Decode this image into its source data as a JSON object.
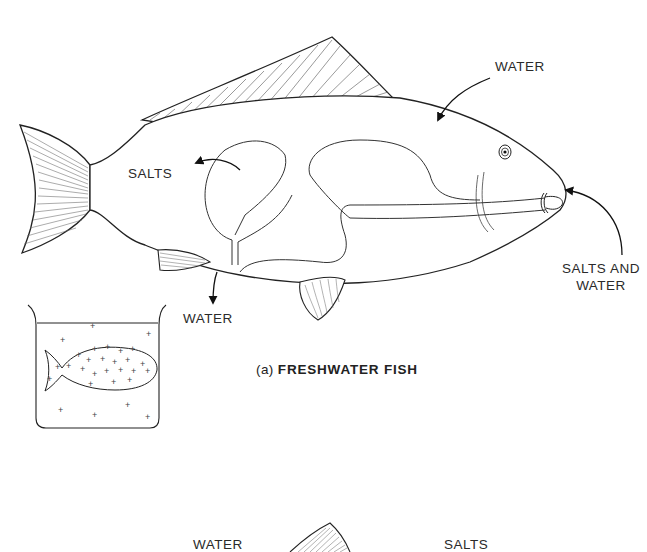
{
  "figure": {
    "panel_a": {
      "caption_prefix": "(a)",
      "caption_title": "FRESHWATER FISH",
      "labels": {
        "water_in_top": "WATER",
        "salts_out": "SALTS",
        "water_out_bottom": "WATER",
        "salts_and_water_line1": "SALTS AND",
        "salts_and_water_line2": "WATER"
      }
    },
    "panel_b_partial": {
      "labels": {
        "water": "WATER",
        "salts": "SALTS"
      }
    }
  }
}
